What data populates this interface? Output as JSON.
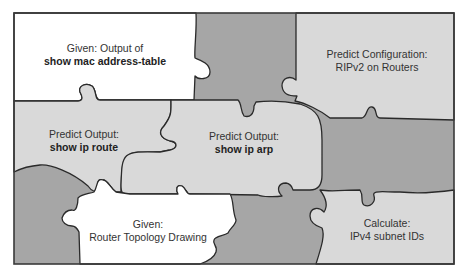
{
  "colors": {
    "white_piece": "#ffffff",
    "light_piece": "#d9d9d9",
    "dark_piece": "#a6a6a6",
    "outline": "#2a2a2a",
    "text": "#333333"
  },
  "pieces": [
    {
      "id": "given-mac-table",
      "fill": "white",
      "line1": "Given: Output of",
      "line2": "show mac address-table",
      "line2_bold": true
    },
    {
      "id": "predict-rip-config",
      "fill": "light",
      "line1": "Predict Configuration:",
      "line2": "RIPv2 on Routers",
      "line2_bold": false
    },
    {
      "id": "predict-ip-route",
      "fill": "light",
      "line1": "Predict Output:",
      "line2": "show ip route",
      "line2_bold": true
    },
    {
      "id": "predict-ip-arp",
      "fill": "light",
      "line1": "Predict Output:",
      "line2": "show ip arp",
      "line2_bold": true
    },
    {
      "id": "given-topology",
      "fill": "white",
      "line1": "Given:",
      "line2": "Router Topology Drawing",
      "line2_bold": false
    },
    {
      "id": "calculate-subnets",
      "fill": "light",
      "line1": "Calculate:",
      "line2": "IPv4 subnet IDs",
      "line2_bold": false
    }
  ]
}
